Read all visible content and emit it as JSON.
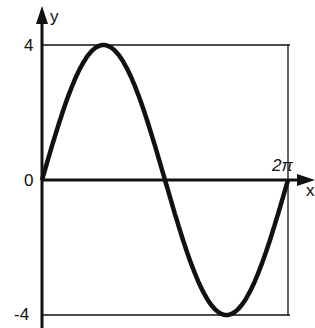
{
  "chart_data": {
    "type": "line",
    "title": "",
    "xlabel": "x",
    "ylabel": "y",
    "function": "y = 4 sin x",
    "x_ticks": [
      "0",
      "2π"
    ],
    "y_ticks": [
      "4",
      "0",
      "-4"
    ],
    "xlim": [
      0,
      6.2832
    ],
    "ylim": [
      -4,
      4
    ],
    "series": [
      {
        "name": "4 sin x",
        "x": [
          0,
          0.7854,
          1.5708,
          2.3562,
          3.1416,
          3.927,
          4.7124,
          5.4978,
          6.2832
        ],
        "values": [
          0,
          2.83,
          4,
          2.83,
          0,
          -2.83,
          -4,
          -2.83,
          0
        ]
      }
    ],
    "grid": false,
    "legend": "none"
  },
  "labels": {
    "y_axis": "y",
    "x_axis": "x",
    "y_max": "4",
    "y_zero": "0",
    "y_min": "-4",
    "x_period": "2π"
  }
}
